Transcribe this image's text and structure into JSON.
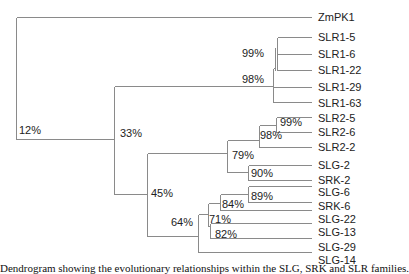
{
  "tree": {
    "leaves": [
      {
        "label": "ZmPK1",
        "y": 17
      },
      {
        "label": "SLR1-5",
        "y": 37
      },
      {
        "label": "SLR1-6",
        "y": 54
      },
      {
        "label": "SLR1-22",
        "y": 70
      },
      {
        "label": "SLR1-29",
        "y": 87
      },
      {
        "label": "SLR1-63",
        "y": 102
      },
      {
        "label": "SLR2-5",
        "y": 118
      },
      {
        "label": "SLR2-6",
        "y": 132
      },
      {
        "label": "SLR2-2",
        "y": 147
      },
      {
        "label": "SLG-2",
        "y": 165
      },
      {
        "label": "SRK-2",
        "y": 180
      },
      {
        "label": "SLG-6",
        "y": 192
      },
      {
        "label": "SRK-6",
        "y": 206
      },
      {
        "label": "SLG-22",
        "y": 219
      },
      {
        "label": "SLG-13",
        "y": 232
      },
      {
        "label": "SLG-29",
        "y": 247
      },
      {
        "label": "SLG-14",
        "y": 260
      }
    ],
    "bootstrap": [
      {
        "value": "12%",
        "x": 19,
        "y": 124
      },
      {
        "value": "33%",
        "x": 120,
        "y": 127
      },
      {
        "value": "98%",
        "x": 242,
        "y": 73
      },
      {
        "value": "99%",
        "x": 242,
        "y": 47
      },
      {
        "value": "99%",
        "x": 280,
        "y": 116
      },
      {
        "value": "98%",
        "x": 260,
        "y": 129
      },
      {
        "value": "79%",
        "x": 232,
        "y": 149
      },
      {
        "value": "90%",
        "x": 251,
        "y": 167
      },
      {
        "value": "45%",
        "x": 151,
        "y": 187
      },
      {
        "value": "89%",
        "x": 251,
        "y": 192
      },
      {
        "value": "84%",
        "x": 222,
        "y": 198
      },
      {
        "value": "64%",
        "x": 171,
        "y": 216
      },
      {
        "value": "71%",
        "x": 209,
        "y": 213
      },
      {
        "value": "82%",
        "x": 215,
        "y": 229
      }
    ]
  },
  "caption": "Dendrogram showing the evolutionary relationships within the SLG, SRK and SLR families."
}
